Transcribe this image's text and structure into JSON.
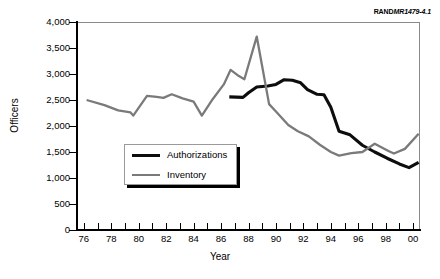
{
  "source_id": {
    "prefix": "RAND",
    "suffix": "MR1479-4.1"
  },
  "chart_data": {
    "type": "line",
    "title": "",
    "xlabel": "Year",
    "ylabel": "Officers",
    "xlim": [
      75.5,
      100.5
    ],
    "ylim": [
      0,
      4000
    ],
    "grid": false,
    "legend_position": "center-left",
    "x_tick_labels": [
      "76",
      "78",
      "80",
      "82",
      "84",
      "86",
      "88",
      "90",
      "92",
      "94",
      "96",
      "98",
      "00"
    ],
    "x_tick_values": [
      76,
      78,
      80,
      82,
      84,
      86,
      88,
      90,
      92,
      94,
      96,
      98,
      100
    ],
    "x_minor_ticks": [
      76,
      77,
      78,
      79,
      80,
      81,
      82,
      83,
      84,
      85,
      86,
      87,
      88,
      89,
      90,
      91,
      92,
      93,
      94,
      95,
      96,
      97,
      98,
      99,
      100
    ],
    "y_tick_labels": [
      "0",
      "500",
      "1,000",
      "1,500",
      "2,000",
      "2,500",
      "3,000",
      "3,500",
      "4,000"
    ],
    "y_tick_values": [
      0,
      500,
      1000,
      1500,
      2000,
      2500,
      3000,
      3500,
      4000
    ],
    "colors": {
      "authorizations": "#0d0d0d",
      "inventory": "#7a7a7a",
      "frame": "#8a8a8a"
    },
    "series": [
      {
        "name": "Authorizations",
        "color": "#0d0d0d",
        "x": [
          86.6,
          87.6,
          88.0,
          88.6,
          89.4,
          90.0,
          90.6,
          91.2,
          91.8,
          92.3,
          93.0,
          93.5,
          94.0,
          94.6,
          95.4,
          96.3,
          97.2,
          98.1,
          99.0,
          99.7,
          100.4
        ],
        "values": [
          2560,
          2550,
          2640,
          2750,
          2770,
          2800,
          2890,
          2880,
          2830,
          2700,
          2610,
          2600,
          2360,
          1900,
          1830,
          1630,
          1500,
          1380,
          1270,
          1200,
          1300
        ]
      },
      {
        "name": "Inventory",
        "color": "#7a7a7a",
        "x": [
          76.2,
          77.5,
          78.5,
          79.4,
          79.6,
          80.6,
          81.3,
          81.8,
          82.4,
          83.2,
          84.0,
          84.6,
          85.4,
          86.2,
          86.7,
          87.3,
          87.7,
          88.6,
          89.5,
          90.0,
          90.9,
          91.6,
          92.4,
          93.2,
          94.0,
          94.6,
          95.5,
          96.3,
          97.2,
          98.2,
          98.6,
          99.4,
          100.4
        ],
        "values": [
          2500,
          2400,
          2300,
          2260,
          2200,
          2580,
          2560,
          2540,
          2610,
          2530,
          2470,
          2200,
          2520,
          2800,
          3080,
          2960,
          2900,
          3720,
          2420,
          2280,
          2020,
          1900,
          1800,
          1640,
          1500,
          1430,
          1480,
          1500,
          1660,
          1520,
          1470,
          1560,
          1850
        ]
      }
    ]
  },
  "legend": {
    "items": [
      {
        "label": "Authorizations",
        "color": "#0d0d0d"
      },
      {
        "label": "Inventory",
        "color": "#7a7a7a"
      }
    ]
  }
}
